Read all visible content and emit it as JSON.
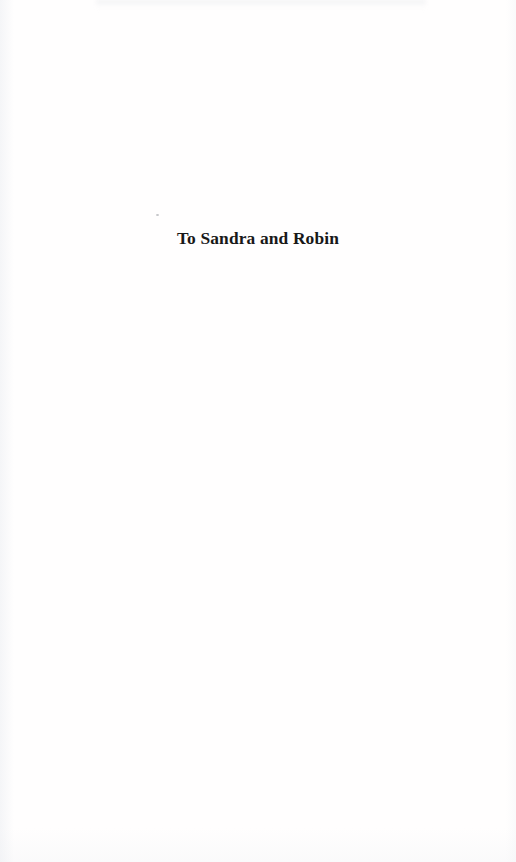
{
  "document": {
    "kind": "scanned-book-page",
    "page_type": "dedication",
    "page_width": 516,
    "page_height": 862,
    "background_color": "#fffefe",
    "ink_color": "#181818"
  },
  "dedication": {
    "text": "To Sandra and Robin"
  },
  "artifacts": {
    "speck_label": "",
    "top_smudge_label": "",
    "paper_tone_label": ""
  }
}
